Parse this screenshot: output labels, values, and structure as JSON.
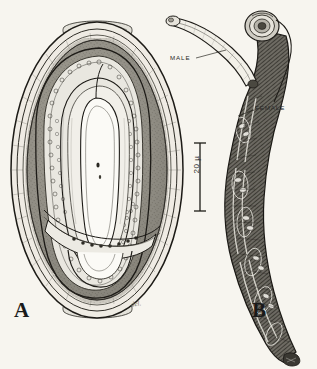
{
  "figure": {
    "background_color": "#f7f5ef",
    "ink_color": "#1d1b17",
    "panels": [
      {
        "letter": "A",
        "name": "embryonated-egg-with-coiled-larva",
        "description": "Oval egg with thick shell, opercula at both poles, containing a coiled larva"
      },
      {
        "letter": "B",
        "name": "male-and-female-worms-in-copula",
        "description": "Slender male worm attached to a thicker coiled-headed female worm"
      }
    ]
  },
  "panel_a": {
    "letter": "A",
    "signature": "del.",
    "scale_bar": {
      "label": "20 µ",
      "orientation": "vertical",
      "top_y": 143,
      "bottom_y": 211
    }
  },
  "panel_b": {
    "letter": "B",
    "labels": [
      {
        "name": "male-label",
        "text": "MALE"
      },
      {
        "name": "female-label",
        "text": "FEMALE"
      }
    ]
  },
  "colors": {
    "background": "#f7f5ef",
    "ink": "#1d1b17",
    "mid_tone": "#8b8madjust",
    "shell_fill": "#c9c6bd",
    "interior_fill": "#8e8c83",
    "light_fill": "#efede6"
  }
}
